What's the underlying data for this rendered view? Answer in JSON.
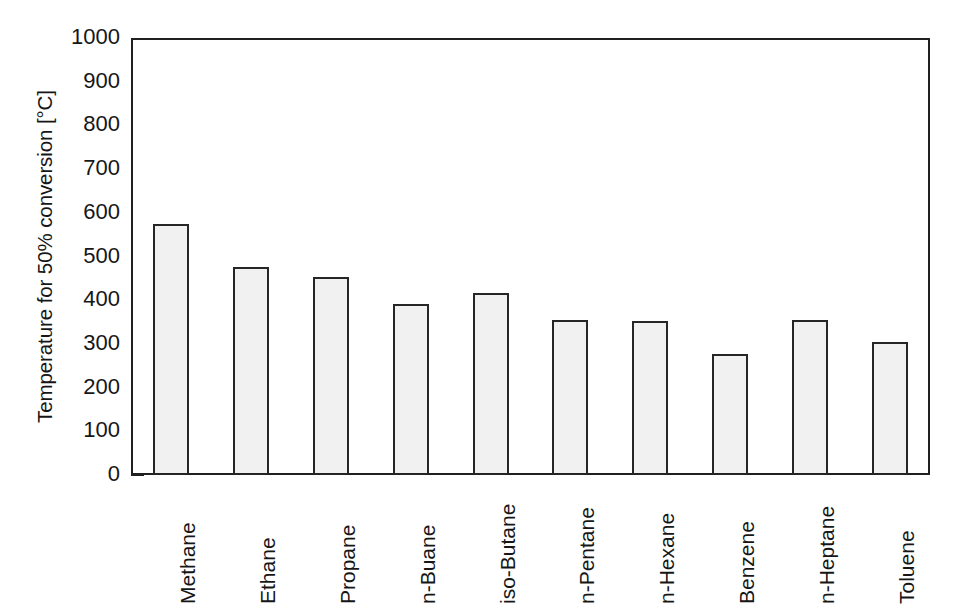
{
  "chart_data": {
    "type": "bar",
    "title": "",
    "xlabel": "",
    "ylabel": "Temperature for 50% conversion [°C]",
    "ylim": [
      0,
      1000
    ],
    "ytick_labels": [
      "1000",
      "900",
      "800",
      "700",
      "600",
      "500",
      "400",
      "300",
      "200",
      "100",
      "0"
    ],
    "ytick_values": [
      1000,
      900,
      800,
      700,
      600,
      500,
      400,
      300,
      200,
      100,
      0
    ],
    "grid": false,
    "legend": null,
    "categories": [
      "Methane",
      "Ethane",
      "Propane",
      "n-Buane",
      "iso-Butane",
      "n-Pentane",
      "n-Hexane",
      "Benzene",
      "n-Heptane",
      "Toluene"
    ],
    "values": [
      580,
      480,
      458,
      395,
      420,
      360,
      357,
      282,
      360,
      308
    ],
    "bar_fill_color": "#f1f1f1",
    "bar_edge_color": "#262626",
    "axis_color": "#202020",
    "background_color": "#ffffff"
  }
}
